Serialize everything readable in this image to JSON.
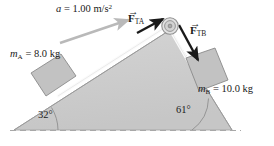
{
  "figure": {
    "colors": {
      "wedge_fill": "#cdcdcd",
      "wedge_edge": "#9a9a9a",
      "block_fill": "#c2c2c2",
      "block_edge": "#8a8a8a",
      "accel_arrow": "#b9b9b9",
      "force_arrow": "#1a1a1a",
      "string": "#fbfbfb",
      "baseline_dash": "#a8a8a8",
      "pulley_ring": "#8f8f8f",
      "text": "#1a1a1a"
    }
  },
  "labels": {
    "acceleration": {
      "symbol": "a",
      "equals": "=",
      "value": "1.00",
      "unit_base": "m/s",
      "unit_exp": "2",
      "full_text": "a = 1.00 m/s²"
    },
    "tension_a": {
      "symbol": "F",
      "subscript": "TA",
      "arrow": "→",
      "full_text": "F_TA"
    },
    "tension_b": {
      "symbol": "F",
      "subscript": "TB",
      "arrow": "→",
      "full_text": "F_TB"
    },
    "mass_a": {
      "symbol": "m",
      "subscript": "A",
      "equals": "=",
      "value": "8.0",
      "unit": "kg",
      "full_text": "m_A = 8.0 kg"
    },
    "mass_b": {
      "symbol": "m",
      "subscript": "B",
      "equals": "=",
      "value": "10.0",
      "unit": "kg",
      "full_text": "m_B = 10.0 kg"
    },
    "angle_left": {
      "value": "32",
      "degree": "°",
      "full_text": "32°"
    },
    "angle_right": {
      "value": "61",
      "degree": "°",
      "full_text": "61°"
    }
  },
  "geometry": {
    "apex": {
      "x": 170,
      "y": 30
    },
    "left_base": {
      "x": 14,
      "y": 130
    },
    "right_base": {
      "x": 232,
      "y": 130
    },
    "pulley_center": {
      "x": 170,
      "y": 26
    },
    "pulley_radius": 8
  }
}
